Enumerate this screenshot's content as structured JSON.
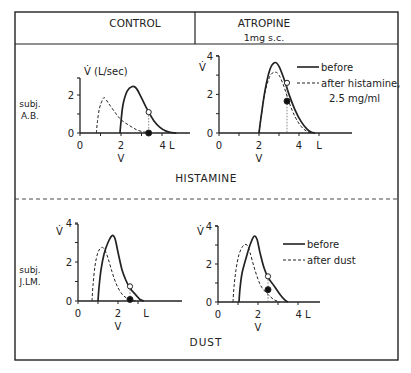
{
  "header": {
    "left_title": "CONTROL",
    "right_title": "ATROPINE",
    "right_subtitle": "1mg s.c."
  },
  "sections": [
    {
      "label": "HISTAMINE",
      "subject": [
        "subj.",
        "A.B."
      ]
    },
    {
      "label": "DUST",
      "subject": [
        "subj.",
        "J.LM."
      ]
    }
  ],
  "chart_data": [
    {
      "type": "line",
      "panel": "control-histamine",
      "subject": "A.B.",
      "ylabel": "V̇ (L/sec)",
      "xlabel": "V",
      "x_ticks": [
        "0",
        "2",
        "4 L"
      ],
      "y_ticks": [
        "0",
        "2"
      ],
      "xlim": [
        0,
        5.4
      ],
      "ylim": [
        0,
        3
      ],
      "series": [
        {
          "name": "before",
          "style": "solid",
          "x": [
            1.95,
            2.0,
            2.1,
            2.3,
            2.55,
            2.75,
            3.0,
            3.3,
            3.6,
            3.9,
            4.2,
            4.5,
            4.7
          ],
          "y": [
            0,
            0.6,
            1.5,
            2.2,
            2.45,
            2.35,
            1.85,
            1.2,
            0.65,
            0.3,
            0.1,
            0.02,
            0
          ]
        },
        {
          "name": "after histamine",
          "style": "dashed",
          "x": [
            0.8,
            0.85,
            0.95,
            1.1,
            1.2,
            1.4,
            1.7,
            2.0,
            2.4,
            2.8,
            3.2,
            3.5
          ],
          "y": [
            0,
            0.6,
            1.3,
            1.75,
            1.85,
            1.55,
            1.1,
            0.7,
            0.4,
            0.15,
            0.04,
            0
          ]
        }
      ],
      "markers": [
        {
          "x": 3.35,
          "y": 1.1,
          "type": "open"
        },
        {
          "x": 3.35,
          "y": 0,
          "type": "filled"
        }
      ]
    },
    {
      "type": "line",
      "panel": "atropine-histamine",
      "subject": "A.B.",
      "ylabel": "V̇",
      "xlabel": "V",
      "x_ticks": [
        "0",
        "2",
        "4",
        "L"
      ],
      "y_ticks": [
        "0",
        "2",
        "4"
      ],
      "xlim": [
        0,
        6.3
      ],
      "ylim": [
        0,
        4
      ],
      "legend": [
        "before",
        "after histamine,",
        "2.5 mg/ml"
      ],
      "series": [
        {
          "name": "before",
          "style": "solid",
          "x": [
            2.0,
            2.1,
            2.3,
            2.55,
            2.8,
            3.0,
            3.25,
            3.5,
            3.8,
            4.1,
            4.4,
            4.6,
            4.8
          ],
          "y": [
            0,
            0.8,
            2.2,
            3.3,
            3.65,
            3.45,
            2.8,
            2.0,
            1.2,
            0.6,
            0.2,
            0.05,
            0
          ]
        },
        {
          "name": "after histamine, 2.5 mg/ml",
          "style": "dashed",
          "x": [
            2.0,
            2.1,
            2.3,
            2.55,
            2.8,
            3.0,
            3.25,
            3.5,
            3.8,
            4.1,
            4.4,
            4.7
          ],
          "y": [
            0,
            0.8,
            2.1,
            2.95,
            3.15,
            3.0,
            2.4,
            1.6,
            0.85,
            0.35,
            0.08,
            0
          ]
        }
      ],
      "markers": [
        {
          "x": 3.4,
          "y": 2.6,
          "type": "open"
        },
        {
          "x": 3.4,
          "y": 1.65,
          "type": "filled"
        }
      ]
    },
    {
      "type": "line",
      "panel": "control-dust",
      "subject": "J.LM.",
      "ylabel": "V̇",
      "xlabel": "V",
      "x_ticks": [
        "0",
        "2",
        "L"
      ],
      "y_ticks": [
        "0",
        "2",
        "4"
      ],
      "xlim": [
        0,
        5.3
      ],
      "ylim": [
        0,
        4
      ],
      "series": [
        {
          "name": "before",
          "style": "solid",
          "x": [
            1.0,
            1.05,
            1.15,
            1.3,
            1.5,
            1.7,
            1.85,
            2.0,
            2.2,
            2.4,
            2.6,
            2.9,
            3.1,
            3.3
          ],
          "y": [
            0,
            0.7,
            1.6,
            2.4,
            3.0,
            3.35,
            3.2,
            2.5,
            1.6,
            1.05,
            0.65,
            0.3,
            0.08,
            0
          ]
        },
        {
          "name": "after dust",
          "style": "dashed",
          "x": [
            0.7,
            0.75,
            0.85,
            1.0,
            1.2,
            1.35,
            1.5,
            1.7,
            1.9,
            2.1,
            2.3,
            2.6,
            2.9
          ],
          "y": [
            0,
            0.8,
            1.8,
            2.5,
            2.75,
            2.6,
            2.2,
            1.5,
            0.9,
            0.5,
            0.25,
            0.05,
            0
          ]
        }
      ],
      "markers": [
        {
          "x": 2.6,
          "y": 0.75,
          "type": "open"
        },
        {
          "x": 2.6,
          "y": 0.08,
          "type": "filled"
        }
      ]
    },
    {
      "type": "line",
      "panel": "atropine-dust",
      "subject": "J.LM.",
      "ylabel": "V̇",
      "xlabel": "V",
      "x_ticks": [
        "0",
        "2",
        "4 L"
      ],
      "y_ticks": [
        "0",
        "2",
        "4"
      ],
      "xlim": [
        0,
        5.3
      ],
      "ylim": [
        0,
        4
      ],
      "legend": [
        "before",
        "after dust"
      ],
      "series": [
        {
          "name": "before",
          "style": "solid",
          "x": [
            1.05,
            1.1,
            1.2,
            1.4,
            1.6,
            1.8,
            1.95,
            2.1,
            2.3,
            2.5,
            2.8,
            3.1,
            3.35,
            3.5
          ],
          "y": [
            0,
            0.7,
            1.5,
            2.3,
            3.0,
            3.45,
            3.3,
            2.6,
            1.8,
            1.3,
            0.85,
            0.4,
            0.1,
            0
          ]
        },
        {
          "name": "after dust",
          "style": "dashed",
          "x": [
            0.75,
            0.8,
            0.9,
            1.05,
            1.25,
            1.45,
            1.6,
            1.8,
            2.0,
            2.2,
            2.5,
            2.8,
            3.1
          ],
          "y": [
            0,
            0.8,
            1.7,
            2.5,
            2.95,
            3.0,
            2.6,
            1.85,
            1.2,
            0.75,
            0.4,
            0.12,
            0
          ]
        }
      ],
      "markers": [
        {
          "x": 2.5,
          "y": 1.35,
          "type": "open"
        },
        {
          "x": 2.5,
          "y": 0.65,
          "type": "filled"
        }
      ]
    }
  ]
}
